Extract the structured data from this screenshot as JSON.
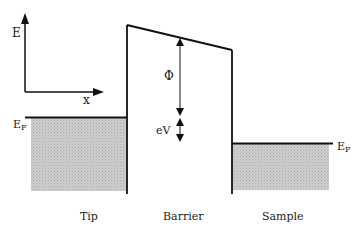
{
  "diagram": {
    "type": "energy-band-diagram",
    "axes": {
      "y_label": "E",
      "x_label": "x"
    },
    "regions": [
      {
        "id": "tip",
        "label": "Tip"
      },
      {
        "id": "barrier",
        "label": "Barrier"
      },
      {
        "id": "sample",
        "label": "Sample"
      }
    ],
    "fermi_levels": {
      "tip": {
        "label_main": "E",
        "label_sub": "F"
      },
      "sample": {
        "label_main": "E",
        "label_sub": "F"
      }
    },
    "annotations": {
      "work_function": "Φ",
      "bias": "eV"
    },
    "colors": {
      "line": "#111111",
      "fill": "#c8c8c8"
    }
  }
}
